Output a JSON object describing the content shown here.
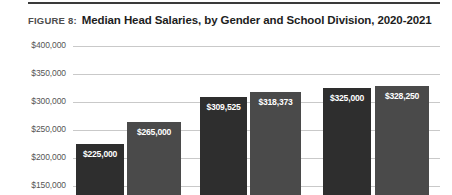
{
  "figure": {
    "label": "FIGURE 8:",
    "title": "Median Head Salaries, by Gender and School Division, 2020-2021"
  },
  "chart_data": {
    "type": "bar",
    "title": "Median Head Salaries, by Gender and School Division, 2020-2021",
    "xlabel": "",
    "ylabel": "",
    "categories": [
      "",
      "",
      "",
      "",
      "",
      ""
    ],
    "values": [
      225000,
      265000,
      309525,
      318373,
      325000,
      328250
    ],
    "data_labels": [
      "$225,000",
      "$265,000",
      "$309,525",
      "$318,373",
      "$325,000",
      "$328,250"
    ],
    "bar_colors": [
      "#2e2e2e",
      "#4a4a4a",
      "#2e2e2e",
      "#4a4a4a",
      "#2e2e2e",
      "#4a4a4a"
    ],
    "ytick_labels": [
      "$400,000",
      "$350,000",
      "$300,000",
      "$250,000",
      "$200,000",
      "$150,000"
    ],
    "ytick_values": [
      400000,
      350000,
      300000,
      250000,
      200000,
      150000
    ],
    "ylim": [
      150000,
      400000
    ],
    "grid": true,
    "legend": "none",
    "note": "bottom of plot is cropped by the screenshot frame"
  },
  "colors": {
    "bar_dark": "#2e2e2e",
    "bar_light": "#4a4a4a",
    "gridline": "#c9c9c9",
    "rule": "#3a3a3a",
    "tick_text": "#555555",
    "title_text": "#1d1d1d",
    "label_text": "#4e4e4e"
  }
}
